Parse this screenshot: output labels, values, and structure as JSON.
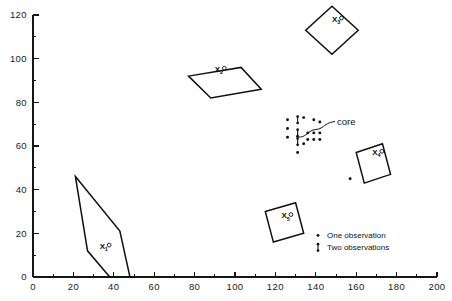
{
  "chart_data": {
    "type": "scatter",
    "title": "",
    "xlabel": "",
    "ylabel": "",
    "xlim": [
      0,
      200
    ],
    "ylim": [
      0,
      120
    ],
    "grid": false,
    "x_ticks": [
      0,
      20,
      40,
      60,
      80,
      100,
      120,
      140,
      160,
      180,
      200
    ],
    "y_ticks": [
      0,
      20,
      40,
      60,
      80,
      100,
      120
    ],
    "x_minor_step": 10,
    "y_minor_step": 10,
    "legend_position": "bottom-right",
    "legend": [
      {
        "marker": "one-observation-dot",
        "label": "One observation"
      },
      {
        "marker": "two-observations-stem",
        "label": "Two observations"
      }
    ],
    "annotations": [
      {
        "text": "core",
        "x": 152,
        "y": 73,
        "points_to_x": 138,
        "points_to_y": 69
      }
    ],
    "regions": [
      {
        "name": "X1",
        "label": "X",
        "subscript": "1",
        "shape": "polygon",
        "label_x": 33,
        "label_y": 13,
        "vertices": [
          [
            21,
            46
          ],
          [
            43,
            21
          ],
          [
            48,
            0
          ],
          [
            38,
            0
          ],
          [
            27,
            12
          ]
        ]
      },
      {
        "name": "X2",
        "label": "X",
        "subscript": "2",
        "shape": "parallelogram",
        "label_x": 90,
        "label_y": 94,
        "vertices": [
          [
            77,
            92
          ],
          [
            103,
            96
          ],
          [
            113,
            86
          ],
          [
            88,
            82
          ]
        ]
      },
      {
        "name": "X3",
        "label": "X",
        "subscript": "3",
        "shape": "diamond",
        "label_x": 148,
        "label_y": 117,
        "vertices": [
          [
            148,
            124
          ],
          [
            161,
            113
          ],
          [
            148,
            102
          ],
          [
            135,
            113
          ]
        ]
      },
      {
        "name": "X4",
        "label": "X",
        "subscript": "4",
        "shape": "square-rotated",
        "label_x": 168,
        "label_y": 56,
        "vertices": [
          [
            160,
            57
          ],
          [
            173,
            61
          ],
          [
            177,
            47
          ],
          [
            164,
            43
          ]
        ]
      },
      {
        "name": "X5",
        "label": "X",
        "subscript": "5",
        "shape": "square-rotated",
        "label_x": 123,
        "label_y": 27,
        "vertices": [
          [
            115,
            30
          ],
          [
            130,
            34
          ],
          [
            134,
            20
          ],
          [
            119,
            16
          ]
        ]
      }
    ],
    "series": [
      {
        "name": "One observation",
        "marker": "dot",
        "points": [
          [
            126,
            72
          ],
          [
            126,
            68
          ],
          [
            126,
            64
          ],
          [
            134,
            73
          ],
          [
            134,
            61
          ],
          [
            139,
            72
          ],
          [
            142,
            71
          ],
          [
            136,
            66
          ],
          [
            139,
            66
          ],
          [
            142,
            66
          ],
          [
            136,
            63
          ],
          [
            139,
            63
          ],
          [
            142,
            63
          ],
          [
            131,
            57
          ],
          [
            157,
            45
          ]
        ]
      },
      {
        "name": "Two observations",
        "marker": "stem",
        "points": [
          [
            131,
            72
          ],
          [
            131,
            66
          ],
          [
            131,
            62
          ]
        ]
      }
    ]
  }
}
